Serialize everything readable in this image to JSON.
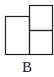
{
  "figure": {
    "label": "B",
    "stroke_color": "#222222",
    "shapes": {
      "left_rect": {
        "x": 5,
        "y": 16,
        "w": 24,
        "h": 38
      },
      "right_top_rect": {
        "x": 29,
        "y": 5,
        "w": 23,
        "h": 25
      },
      "right_bottom_rect": {
        "x": 29,
        "y": 30,
        "w": 23,
        "h": 24
      }
    }
  }
}
